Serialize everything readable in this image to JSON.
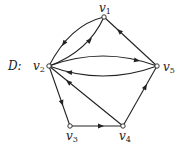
{
  "graph": {
    "name": "D",
    "name_label": "D:",
    "type": "directed",
    "nodes": [
      {
        "id": "v1",
        "label": "v",
        "sub": "1",
        "x": 104,
        "y": 17
      },
      {
        "id": "v2",
        "label": "v",
        "sub": "2",
        "x": 49,
        "y": 66
      },
      {
        "id": "v3",
        "label": "v",
        "sub": "3",
        "x": 70,
        "y": 126
      },
      {
        "id": "v4",
        "label": "v",
        "sub": "4",
        "x": 123,
        "y": 126
      },
      {
        "id": "v5",
        "label": "v",
        "sub": "5",
        "x": 157,
        "y": 66
      }
    ],
    "edges": [
      {
        "from": "v1",
        "to": "v2",
        "shape": "curve-outer"
      },
      {
        "from": "v2",
        "to": "v1",
        "shape": "curve-inner"
      },
      {
        "from": "v5",
        "to": "v1",
        "shape": "straight"
      },
      {
        "from": "v2",
        "to": "v5",
        "shape": "curve-upper"
      },
      {
        "from": "v5",
        "to": "v2",
        "shape": "curve-lower"
      },
      {
        "from": "v2",
        "to": "v3",
        "shape": "straight"
      },
      {
        "from": "v3",
        "to": "v4",
        "shape": "straight"
      },
      {
        "from": "v4",
        "to": "v2",
        "shape": "straight"
      },
      {
        "from": "v4",
        "to": "v5",
        "shape": "straight"
      }
    ]
  },
  "colors": {
    "stroke": "#222222",
    "background": "#ffffff"
  }
}
